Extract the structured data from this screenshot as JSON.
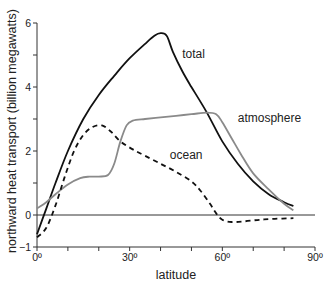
{
  "chart_data": {
    "type": "line",
    "title": "",
    "xlabel": "latitude",
    "ylabel": "northward heat transport (billion megawatts)",
    "xlim": [
      0,
      90
    ],
    "ylim": [
      -1,
      6
    ],
    "x_ticks": [
      0,
      10,
      20,
      30,
      40,
      50,
      60,
      70,
      80,
      90
    ],
    "x_tick_labels": [
      {
        "value": 0,
        "label": "0º"
      },
      {
        "value": 30,
        "label": "30º"
      },
      {
        "value": 60,
        "label": "60º"
      },
      {
        "value": 90,
        "label": "90º"
      }
    ],
    "y_ticks": [
      -1,
      0,
      1,
      2,
      3,
      4,
      5,
      6
    ],
    "y_tick_labels": [
      {
        "value": -1,
        "label": "−1"
      },
      {
        "value": 0,
        "label": "0"
      },
      {
        "value": 2,
        "label": "2"
      },
      {
        "value": 4,
        "label": "4"
      },
      {
        "value": 6,
        "label": "6"
      }
    ],
    "grid": false,
    "zero_line": true,
    "legend": "inline labels",
    "series": [
      {
        "name": "total",
        "style": "solid",
        "color": "#111111",
        "label_pos": {
          "lat": 47,
          "value": 4.9
        },
        "points": [
          [
            0,
            -0.6
          ],
          [
            3,
            0.2
          ],
          [
            6,
            1.0
          ],
          [
            10,
            2.0
          ],
          [
            15,
            3.0
          ],
          [
            20,
            3.75
          ],
          [
            25,
            4.35
          ],
          [
            30,
            4.9
          ],
          [
            35,
            5.35
          ],
          [
            38,
            5.6
          ],
          [
            40,
            5.68
          ],
          [
            42,
            5.6
          ],
          [
            44,
            5.1
          ],
          [
            47,
            4.5
          ],
          [
            50,
            4.0
          ],
          [
            55,
            3.2
          ],
          [
            60,
            2.3
          ],
          [
            65,
            1.6
          ],
          [
            70,
            1.05
          ],
          [
            75,
            0.65
          ],
          [
            80,
            0.4
          ],
          [
            83,
            0.28
          ]
        ]
      },
      {
        "name": "atmosphere",
        "style": "solid",
        "color": "#8a8a8a",
        "label_pos": {
          "lat": 65,
          "value": 2.9
        },
        "points": [
          [
            0,
            0.2
          ],
          [
            3,
            0.4
          ],
          [
            6,
            0.65
          ],
          [
            10,
            0.95
          ],
          [
            14,
            1.15
          ],
          [
            17,
            1.2
          ],
          [
            20,
            1.2
          ],
          [
            23,
            1.25
          ],
          [
            25,
            1.6
          ],
          [
            27,
            2.3
          ],
          [
            29,
            2.8
          ],
          [
            31,
            2.95
          ],
          [
            35,
            3.0
          ],
          [
            40,
            3.05
          ],
          [
            45,
            3.1
          ],
          [
            50,
            3.15
          ],
          [
            55,
            3.2
          ],
          [
            58,
            3.15
          ],
          [
            60,
            2.9
          ],
          [
            63,
            2.4
          ],
          [
            66,
            1.9
          ],
          [
            70,
            1.3
          ],
          [
            75,
            0.8
          ],
          [
            80,
            0.35
          ],
          [
            83,
            0.15
          ]
        ]
      },
      {
        "name": "ocean",
        "style": "dashed",
        "color": "#111111",
        "label_pos": {
          "lat": 43,
          "value": 1.75
        },
        "points": [
          [
            0,
            -0.7
          ],
          [
            3,
            -0.4
          ],
          [
            6,
            0.3
          ],
          [
            9,
            1.2
          ],
          [
            12,
            2.0
          ],
          [
            15,
            2.5
          ],
          [
            18,
            2.75
          ],
          [
            21,
            2.8
          ],
          [
            24,
            2.6
          ],
          [
            27,
            2.3
          ],
          [
            31,
            2.05
          ],
          [
            35,
            1.85
          ],
          [
            40,
            1.6
          ],
          [
            45,
            1.35
          ],
          [
            50,
            1.05
          ],
          [
            53,
            0.75
          ],
          [
            56,
            0.35
          ],
          [
            58,
            0.05
          ],
          [
            60,
            -0.15
          ],
          [
            63,
            -0.22
          ],
          [
            67,
            -0.2
          ],
          [
            72,
            -0.15
          ],
          [
            77,
            -0.12
          ],
          [
            83,
            -0.1
          ]
        ]
      }
    ]
  }
}
